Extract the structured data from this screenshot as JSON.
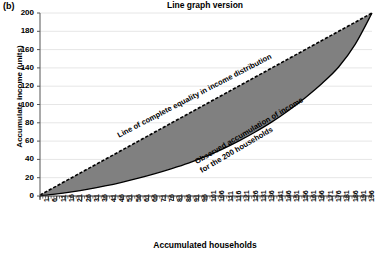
{
  "panel": {
    "label": "(b)"
  },
  "chart_data": {
    "type": "line",
    "title": "Line graph version",
    "xlabel": "Accumulated households",
    "ylabel": "Accumulate income (units)",
    "grid": true,
    "legend_position": "none",
    "xlim": [
      1,
      200
    ],
    "ylim": [
      0,
      200
    ],
    "yticks": [
      0,
      20,
      40,
      60,
      80,
      100,
      120,
      140,
      160,
      180,
      200
    ],
    "xticks": [
      1,
      6,
      11,
      16,
      21,
      26,
      31,
      36,
      41,
      46,
      51,
      56,
      61,
      66,
      71,
      76,
      81,
      86,
      91,
      96,
      101,
      106,
      111,
      116,
      121,
      126,
      131,
      136,
      141,
      146,
      151,
      156,
      161,
      166,
      171,
      176,
      181,
      186,
      191,
      196
    ],
    "annotations": [
      {
        "text": "Line of complete equality in income distribution",
        "rotation": -27.5
      },
      {
        "text": "Observed accumulation of income\nfor the 200 households",
        "rotation": -30.5
      }
    ],
    "series": [
      {
        "name": "Line of complete equality in income distribution",
        "style": "dashed",
        "color": "#000000",
        "x": [
          1,
          20,
          40,
          60,
          80,
          100,
          120,
          140,
          160,
          180,
          200
        ],
        "values": [
          1,
          20,
          40,
          60,
          80,
          100,
          120,
          140,
          160,
          180,
          200
        ]
      },
      {
        "name": "Observed accumulation of income for the 200 households",
        "style": "solid",
        "color": "#000000",
        "fill": "#808080",
        "x": [
          1,
          10,
          20,
          30,
          40,
          50,
          60,
          70,
          80,
          90,
          100,
          110,
          120,
          130,
          140,
          150,
          160,
          170,
          180,
          190,
          200
        ],
        "values": [
          0.3,
          2.0,
          4.5,
          7.5,
          11.0,
          15.0,
          19.5,
          24.5,
          30.0,
          36.0,
          43.0,
          51.0,
          60.0,
          70.0,
          81.0,
          93.5,
          107.5,
          123.0,
          141.0,
          166.0,
          200.0
        ]
      }
    ]
  }
}
